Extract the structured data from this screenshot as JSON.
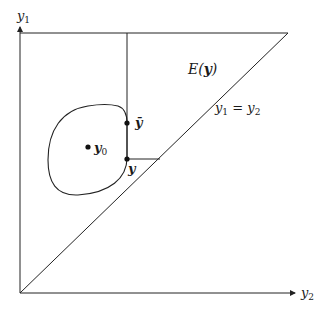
{
  "diagram": {
    "axes": {
      "y_axis_label": "y",
      "y_axis_sub": "1",
      "x_axis_label": "y",
      "x_axis_sub": "2"
    },
    "region_label": "E(",
    "region_label_var": "y",
    "region_label_close": ")",
    "diagonal_label_a": "y",
    "diagonal_label_a_sub": "1",
    "diagonal_label_eq": " = ",
    "diagonal_label_b": "y",
    "diagonal_label_b_sub": "2",
    "points": {
      "y0": {
        "label": "y",
        "sub": "0"
      },
      "ybar": {
        "label": "ȳ"
      },
      "y": {
        "label": "y"
      }
    },
    "line_color": "#222222"
  }
}
